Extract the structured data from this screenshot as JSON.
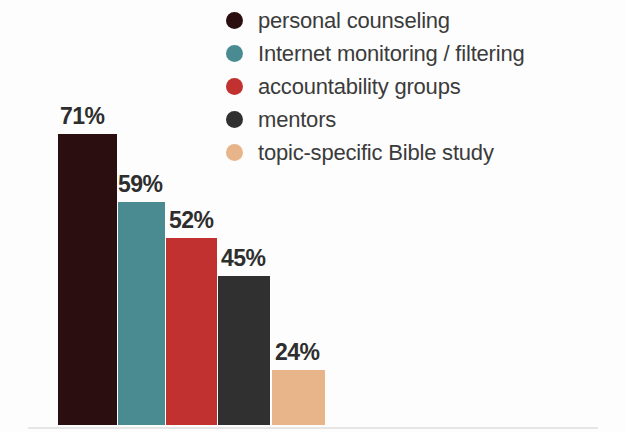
{
  "chart_data": {
    "type": "bar",
    "title": "",
    "subtitle": "",
    "xlabel": "",
    "ylabel": "",
    "ylim": [
      0,
      100
    ],
    "grid": false,
    "legend_position": "top-right",
    "categories": [
      "personal counseling",
      "Internet monitoring / filtering",
      "accountability groups",
      "mentors",
      "topic-specific Bible study"
    ],
    "values": [
      71,
      59,
      52,
      45,
      24
    ],
    "value_labels": [
      "71%",
      "59%",
      "52%",
      "45%",
      "24%"
    ],
    "colors": [
      "#2b0f10",
      "#4a8b92",
      "#c0312f",
      "#303030",
      "#e8b48a"
    ],
    "series": [
      {
        "name": "",
        "values": [
          71,
          59,
          52,
          45,
          24
        ]
      }
    ]
  },
  "legend": {
    "items": [
      {
        "label": "personal counseling",
        "color": "#2b0f10"
      },
      {
        "label": "Internet monitoring / filtering",
        "color": "#4a8b92"
      },
      {
        "label": "accountability groups",
        "color": "#c0312f"
      },
      {
        "label": "mentors",
        "color": "#303030"
      },
      {
        "label": "topic-specific Bible study",
        "color": "#e8b48a"
      }
    ]
  },
  "bars": [
    {
      "label": "personal counseling",
      "value_label": "71%",
      "color": "#2b0f10",
      "left": 58,
      "width": 59,
      "top": 134,
      "label_left": 60,
      "label_top": 103
    },
    {
      "label": "Internet monitoring / filtering",
      "value_label": "59%",
      "color": "#4a8b92",
      "left": 118,
      "width": 47,
      "top": 202,
      "label_left": 118,
      "label_top": 171
    },
    {
      "label": "accountability groups",
      "value_label": "52%",
      "color": "#c0312f",
      "left": 166,
      "width": 51,
      "top": 238,
      "label_left": 169,
      "label_top": 207
    },
    {
      "label": "mentors",
      "value_label": "45%",
      "color": "#303030",
      "left": 218,
      "width": 52,
      "top": 276,
      "label_left": 221,
      "label_top": 245
    },
    {
      "label": "topic-specific Bible study",
      "value_label": "24%",
      "color": "#e8b48a",
      "left": 272,
      "width": 53,
      "top": 370,
      "label_left": 275,
      "label_top": 339
    }
  ]
}
